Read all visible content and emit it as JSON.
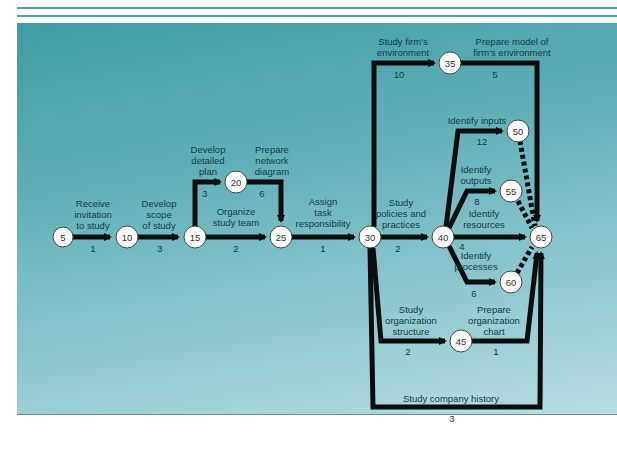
{
  "diagram": {
    "type": "PERT network diagram",
    "nodes": [
      {
        "id": "5",
        "label": "5",
        "x": 63,
        "y": 237
      },
      {
        "id": "10",
        "label": "10",
        "x": 127,
        "y": 237
      },
      {
        "id": "15",
        "label": "15",
        "x": 195,
        "y": 237
      },
      {
        "id": "20",
        "label": "20",
        "x": 236,
        "y": 182
      },
      {
        "id": "25",
        "label": "25",
        "x": 281,
        "y": 237
      },
      {
        "id": "30",
        "label": "30",
        "x": 370,
        "y": 237
      },
      {
        "id": "35",
        "label": "35",
        "x": 450,
        "y": 63
      },
      {
        "id": "40",
        "label": "40",
        "x": 443,
        "y": 237
      },
      {
        "id": "45",
        "label": "45",
        "x": 461,
        "y": 341
      },
      {
        "id": "50",
        "label": "50",
        "x": 518,
        "y": 131
      },
      {
        "id": "55",
        "label": "55",
        "x": 511,
        "y": 191
      },
      {
        "id": "60",
        "label": "60",
        "x": 511,
        "y": 282
      },
      {
        "id": "65",
        "label": "65",
        "x": 541,
        "y": 237
      }
    ],
    "activities": [
      {
        "from": "5",
        "to": "10",
        "label": "Receive invitation to study",
        "duration": "1"
      },
      {
        "from": "10",
        "to": "15",
        "label": "Develop scope of study",
        "duration": "3"
      },
      {
        "from": "15",
        "to": "20",
        "label": "Develop detailed plan",
        "duration": "3"
      },
      {
        "from": "20",
        "to": "25",
        "label": "Prepare network diagram",
        "duration": "6"
      },
      {
        "from": "15",
        "to": "25",
        "label": "Organize study team",
        "duration": "2"
      },
      {
        "from": "25",
        "to": "30",
        "label": "Assign task responsibility",
        "duration": "1"
      },
      {
        "from": "30",
        "to": "35",
        "label": "Study firm's environment",
        "duration": "10"
      },
      {
        "from": "35",
        "to": "65",
        "label": "Prepare model of firm's environment",
        "duration": "5"
      },
      {
        "from": "30",
        "to": "40",
        "label": "Study policies and practices",
        "duration": "2"
      },
      {
        "from": "40",
        "to": "50",
        "label": "Identify inputs",
        "duration": "12"
      },
      {
        "from": "40",
        "to": "55",
        "label": "Identify outputs",
        "duration": "8"
      },
      {
        "from": "40",
        "to": "65",
        "label": "Identify resources",
        "duration": "4"
      },
      {
        "from": "40",
        "to": "60",
        "label": "Identify processes",
        "duration": "6"
      },
      {
        "from": "30",
        "to": "45",
        "label": "Study organization structure",
        "duration": "2"
      },
      {
        "from": "45",
        "to": "65",
        "label": "Prepare organization chart",
        "duration": "1"
      },
      {
        "from": "30",
        "to": "65",
        "label": "Study company history",
        "duration": "3"
      },
      {
        "from": "50",
        "to": "65",
        "label": "",
        "duration": "",
        "dummy": true
      },
      {
        "from": "55",
        "to": "65",
        "label": "",
        "duration": "",
        "dummy": true
      },
      {
        "from": "60",
        "to": "65",
        "label": "",
        "duration": "",
        "dummy": true
      }
    ],
    "labels": {
      "a5_10": [
        "Receive",
        "invitation",
        "to study"
      ],
      "a10_15": [
        "Develop",
        "scope",
        "of study"
      ],
      "a15_20": [
        "Develop",
        "detailed",
        "plan"
      ],
      "a20_25": [
        "Prepare",
        "network",
        "diagram"
      ],
      "a15_25": [
        "Organize",
        "study team"
      ],
      "a25_30": [
        "Assign",
        "task",
        "responsibility"
      ],
      "a30_35": [
        "Study firm's",
        "environment"
      ],
      "a35_65": [
        "Prepare model of",
        "firm's environment"
      ],
      "a30_40": [
        "Study",
        "policies and",
        "practices"
      ],
      "a40_50": [
        "Identify inputs"
      ],
      "a40_55": [
        "Identify",
        "outputs"
      ],
      "a40_65": [
        "Identify",
        "resources"
      ],
      "a40_60": [
        "Identify",
        "processes"
      ],
      "a30_45": [
        "Study",
        "organization",
        "structure"
      ],
      "a45_65": [
        "Prepare",
        "organization",
        "chart"
      ],
      "a30_65": [
        "Study company history"
      ]
    },
    "durations": {
      "d5_10": "1",
      "d10_15": "3",
      "d15_20": "3",
      "d20_25": "6",
      "d15_25": "2",
      "d25_30": "1",
      "d30_35": "10",
      "d35_65": "5",
      "d30_40": "2",
      "d40_50": "12",
      "d40_55": "8",
      "d40_65": "4",
      "d40_60": "6",
      "d30_45": "2",
      "d45_65": "1",
      "d30_65": "3"
    },
    "colors": {
      "background_top": "#3f9da3",
      "background_bottom": "#b7dde2",
      "arrow": "#0d0d0d",
      "node_fill": "#ffffff",
      "text": "#123c44",
      "rule": "#4fa3a6"
    }
  }
}
